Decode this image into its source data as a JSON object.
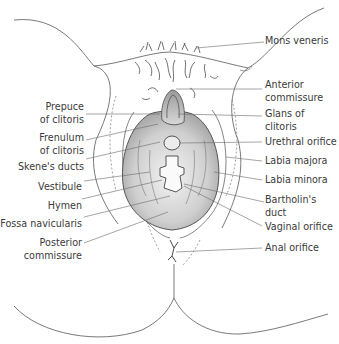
{
  "diagram": {
    "type": "anatomical-illustration",
    "labels_left": [
      {
        "id": "prepuce",
        "text": "Prepuce\nof clitoris"
      },
      {
        "id": "frenulum",
        "text": "Frenulum\nof clitoris"
      },
      {
        "id": "skenes",
        "text": "Skene's ducts"
      },
      {
        "id": "vestibule",
        "text": "Vestibule"
      },
      {
        "id": "hymen",
        "text": "Hymen"
      },
      {
        "id": "fossa",
        "text": "Fossa navicularis"
      },
      {
        "id": "posterior",
        "text": "Posterior\ncommissure"
      }
    ],
    "labels_right": [
      {
        "id": "mons",
        "text": "Mons veneris"
      },
      {
        "id": "anterior",
        "text": "Anterior\ncommissure"
      },
      {
        "id": "glans",
        "text": "Glans of\nclitoris"
      },
      {
        "id": "urethral",
        "text": "Urethral orifice"
      },
      {
        "id": "majora",
        "text": "Labia majora"
      },
      {
        "id": "minora",
        "text": "Labia minora"
      },
      {
        "id": "bartholin",
        "text": "Bartholin's\nduct"
      },
      {
        "id": "vaginal",
        "text": "Vaginal orifice"
      },
      {
        "id": "anal",
        "text": "Anal orifice"
      }
    ],
    "colors": {
      "line": "#555555",
      "shade": "#bdbdbd",
      "text": "#3a3a3a"
    }
  }
}
